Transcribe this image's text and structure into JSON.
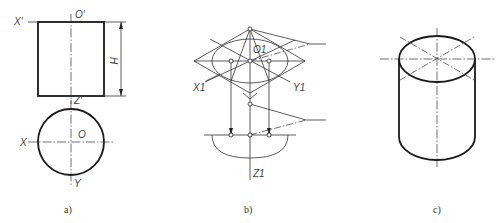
{
  "figure": {
    "panels": [
      {
        "id": "a",
        "caption": "a)",
        "labels": {
          "x_prime": "X'",
          "o_prime": "O'",
          "z_prime": "Z'",
          "height": "H",
          "x": "X",
          "o": "O",
          "y": "Y"
        }
      },
      {
        "id": "b",
        "caption": "b)",
        "labels": {
          "o1": "O1",
          "x1": "X1",
          "y1": "Y1",
          "z1": "Z1"
        }
      },
      {
        "id": "c",
        "caption": "c)"
      }
    ]
  }
}
